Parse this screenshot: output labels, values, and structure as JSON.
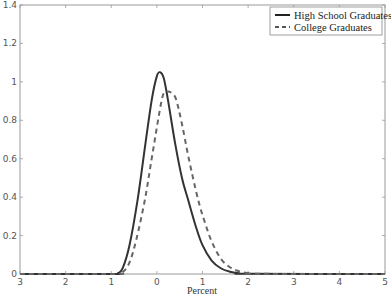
{
  "chart_data": {
    "type": "line",
    "title": "",
    "xlabel": "Percent",
    "ylabel": "",
    "xlim": [
      -3,
      5
    ],
    "ylim": [
      0,
      1.4
    ],
    "grid": false,
    "legend_position": "upper right",
    "x_ticks": [
      -3,
      -2,
      -1,
      0,
      1,
      2,
      3,
      4,
      5
    ],
    "x_tick_labels": [
      "3",
      "2",
      "1",
      "0",
      "1",
      "2",
      "3",
      "4",
      "5"
    ],
    "y_ticks": [
      0,
      0.2,
      0.4,
      0.6,
      0.8,
      1,
      1.2,
      1.4
    ],
    "y_tick_labels": [
      "0",
      "0.2",
      "0.4",
      "0.6",
      "0.8",
      "1",
      "1.2",
      "1.4"
    ],
    "series": [
      {
        "name": "High School Graduates",
        "style": "solid",
        "color": "#333333",
        "x": [
          -3,
          -1.0,
          -0.85,
          -0.75,
          -0.6,
          -0.42,
          -0.25,
          -0.11,
          0.0,
          0.07,
          0.15,
          0.24,
          0.4,
          0.55,
          0.68,
          0.85,
          1.0,
          1.2,
          1.4,
          1.6,
          1.8,
          2.0,
          5
        ],
        "values": [
          0,
          0,
          0.005,
          0.03,
          0.15,
          0.39,
          0.68,
          0.91,
          1.03,
          1.05,
          1.02,
          0.91,
          0.68,
          0.5,
          0.39,
          0.25,
          0.15,
          0.07,
          0.03,
          0.012,
          0.004,
          0.001,
          0
        ]
      },
      {
        "name": "College Graduates",
        "style": "dashed",
        "color": "#666666",
        "x": [
          -3,
          -0.9,
          -0.75,
          -0.6,
          -0.45,
          -0.26,
          -0.1,
          0.11,
          0.2,
          0.26,
          0.33,
          0.42,
          0.55,
          0.7,
          0.9,
          1.05,
          1.2,
          1.4,
          1.6,
          1.8,
          2.0,
          2.2,
          5
        ],
        "values": [
          0,
          0,
          0.01,
          0.06,
          0.18,
          0.39,
          0.62,
          0.91,
          0.94,
          0.95,
          0.94,
          0.91,
          0.78,
          0.6,
          0.39,
          0.27,
          0.17,
          0.08,
          0.035,
          0.014,
          0.005,
          0.001,
          0
        ]
      }
    ]
  }
}
